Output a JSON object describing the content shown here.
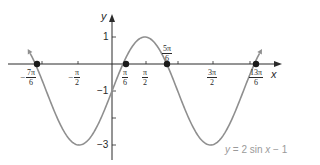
{
  "chart_data": {
    "type": "line",
    "title": "",
    "function": "y = 2 sin x - 1",
    "xlabel": "x",
    "ylabel": "y",
    "xlim_radians": [
      -1.3,
      2.35
    ],
    "ylim": [
      -3.4,
      1.6
    ],
    "grid": false,
    "x_tick_labels": [
      "-7π/6",
      "-π/2",
      "π/6",
      "π/2",
      "5π/6",
      "3π/2",
      "13π/6"
    ],
    "y_tick_labels": [
      "1",
      "-1",
      "-3"
    ],
    "marked_points": [
      {
        "label": "-7π/6",
        "x": -3.665,
        "y": 0
      },
      {
        "label": "π/6",
        "x": 0.524,
        "y": 0
      },
      {
        "label": "5π/6",
        "x": 2.618,
        "y": 0
      },
      {
        "label": "13π/6",
        "x": 6.807,
        "y": 0
      }
    ],
    "series": [
      {
        "name": "y = 2 sin x - 1",
        "color": "#8f8f8f",
        "x_range": [
          "-7π/6 - small",
          "13π/6 + small"
        ],
        "max": 1,
        "min": -3,
        "max_at": [
          "π/2"
        ],
        "min_at": [
          "-π/2",
          "3π/2"
        ]
      }
    ],
    "legend": {
      "text": "y = 2 sin x − 1",
      "position": "bottom-right"
    }
  },
  "axes": {
    "x_letter": "x",
    "y_letter": "y",
    "y_labels": {
      "one": "1",
      "neg_one": "−1",
      "neg_three": "−3"
    }
  },
  "xticks": {
    "neg7pi6": {
      "sign": "−",
      "num": "7π",
      "den": "6"
    },
    "negpi2": {
      "sign": "−",
      "num": "π",
      "den": "2"
    },
    "pi6": {
      "num": "π",
      "den": "6"
    },
    "pi2": {
      "num": "π",
      "den": "2"
    },
    "fivepi6": {
      "num": "5π",
      "den": "6"
    },
    "threepi2": {
      "num": "3π",
      "den": "2"
    },
    "thirteenpi6": {
      "num": "13π",
      "den": "6"
    }
  },
  "equation": {
    "y": "y",
    "rest1": " = 2 sin ",
    "x": "x",
    "rest2": " − 1"
  },
  "colors": {
    "axis": "#2a2a2a",
    "curve": "#8f8f8f",
    "point": "#1a1a1a"
  }
}
